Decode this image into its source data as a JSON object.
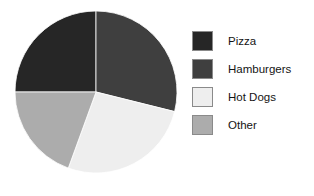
{
  "chart_data": {
    "type": "pie",
    "title": "",
    "categories": [
      "Pizza",
      "Hamburgers",
      "Hot Dogs",
      "Other"
    ],
    "values": [
      25,
      29,
      27,
      19
    ],
    "unit": "percent",
    "start_angle_deg": 0,
    "direction": "clockwise",
    "segments": [
      {
        "label": "Pizza",
        "value": 25,
        "color": "#262626",
        "start_angle_deg": 270,
        "end_angle_deg": 360
      },
      {
        "label": "Hamburgers",
        "value": 29,
        "color": "#3f3f3f",
        "start_angle_deg": 0,
        "end_angle_deg": 104
      },
      {
        "label": "Hot Dogs",
        "value": 27,
        "color": "#eeeeee",
        "start_angle_deg": 104,
        "end_angle_deg": 200
      },
      {
        "label": "Other",
        "value": 19,
        "color": "#acacac",
        "start_angle_deg": 200,
        "end_angle_deg": 270
      }
    ],
    "legend": {
      "position": "right",
      "entries": [
        {
          "label": "Pizza",
          "color": "#262626"
        },
        {
          "label": "Hamburgers",
          "color": "#3f3f3f"
        },
        {
          "label": "Hot Dogs",
          "color": "#eeeeee"
        },
        {
          "label": "Other",
          "color": "#acacac"
        }
      ]
    },
    "geometry": {
      "center_x": 96,
      "center_y": 92,
      "radius": 81
    }
  }
}
